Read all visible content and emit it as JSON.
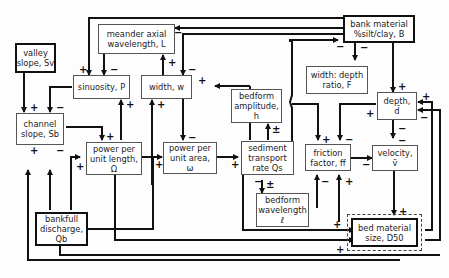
{
  "diagram": {
    "type": "causal feedback diagram",
    "nodes": [
      {
        "id": "valley_slope",
        "label_line1": "valley",
        "label_line2": "slope, Sv",
        "bold": true
      },
      {
        "id": "meander_wavelength",
        "label_line1": "meander axial",
        "label_line2": "wavelength, L",
        "bold": false
      },
      {
        "id": "bank_material",
        "label_line1": "bank material",
        "label_line2": "%silt/clay, B",
        "bold": true
      },
      {
        "id": "sinuosity",
        "label_line1": "sinuosity, P",
        "label_line2": "",
        "bold": false
      },
      {
        "id": "width",
        "label_line1": "width, w",
        "label_line2": "",
        "bold": false
      },
      {
        "id": "width_depth_ratio",
        "label_line1": "width: depth",
        "label_line2": "ratio, F",
        "bold": false
      },
      {
        "id": "bedform_amplitude",
        "label_line1": "bedform",
        "label_line2": "amplitude,",
        "label_line3": "h",
        "bold": false
      },
      {
        "id": "depth",
        "label_line1": "depth,",
        "label_line2": "d̄",
        "bold": false
      },
      {
        "id": "channel_slope",
        "label_line1": "channel",
        "label_line2": "slope, Sb",
        "bold": false
      },
      {
        "id": "power_per_length",
        "label_line1": "power per",
        "label_line2": "unit length,",
        "label_line3": "Ω",
        "bold": false
      },
      {
        "id": "power_per_area",
        "label_line1": "power per",
        "label_line2": "unit area,",
        "label_line3": "ω",
        "bold": false
      },
      {
        "id": "sediment_transport",
        "label_line1": "sediment",
        "label_line2": "transport",
        "label_line3": "rate Qs",
        "bold": false
      },
      {
        "id": "friction_factor",
        "label_line1": "friction",
        "label_line2": "factor, ff",
        "bold": false
      },
      {
        "id": "velocity",
        "label_line1": "velocity,",
        "label_line2": "v̄",
        "bold": false
      },
      {
        "id": "bedform_wavelength",
        "label_line1": "bedform",
        "label_line2": "wavelength",
        "label_line3": "ℓ",
        "bold": false
      },
      {
        "id": "bankfull_discharge",
        "label_line1": "bankfull",
        "label_line2": "discharge,",
        "label_line3": "Qb",
        "bold": true
      },
      {
        "id": "bed_material_size",
        "label_line1": "bed material",
        "label_line2": "size, D50",
        "bold": true
      }
    ],
    "signs": {
      "plus": "+",
      "minus": "−",
      "plus_minus": "±"
    }
  }
}
